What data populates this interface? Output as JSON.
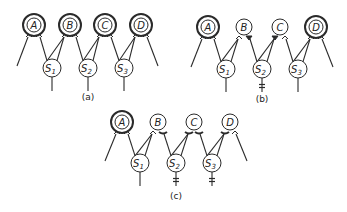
{
  "figure": {
    "panels": [
      {
        "id": "a",
        "caption": "(a)",
        "caption_pos": [
          88,
          100
        ],
        "top_y": 25,
        "bottom_y": 68,
        "units": [
          {
            "label": "A",
            "x": 34,
            "state": "double"
          },
          {
            "label": "B",
            "x": 70,
            "state": "double"
          },
          {
            "label": "C",
            "x": 105,
            "state": "double"
          },
          {
            "label": "D",
            "x": 141,
            "state": "double"
          }
        ],
        "hidden": [
          {
            "label": "S",
            "sub": "1",
            "x": 52,
            "blocked": false
          },
          {
            "label": "S",
            "sub": "2",
            "x": 88,
            "blocked": false
          },
          {
            "label": "S",
            "sub": "3",
            "x": 124,
            "blocked": false
          }
        ],
        "synapses": [
          {
            "unit": 0,
            "side": "left",
            "type": "open"
          },
          {
            "unit": 0,
            "side": "right",
            "type": "open"
          },
          {
            "unit": 1,
            "side": "left",
            "type": "open"
          },
          {
            "unit": 1,
            "side": "right",
            "type": "open"
          },
          {
            "unit": 2,
            "side": "left",
            "type": "open"
          },
          {
            "unit": 2,
            "side": "right",
            "type": "open"
          },
          {
            "unit": 3,
            "side": "left",
            "type": "open"
          },
          {
            "unit": 3,
            "side": "right",
            "type": "open"
          }
        ]
      },
      {
        "id": "b",
        "caption": "(b)",
        "caption_pos": [
          262,
          102
        ],
        "top_y": 27,
        "bottom_y": 69,
        "units": [
          {
            "label": "A",
            "x": 208,
            "state": "double"
          },
          {
            "label": "B",
            "x": 244,
            "state": "single"
          },
          {
            "label": "C",
            "x": 280,
            "state": "single"
          },
          {
            "label": "D",
            "x": 316,
            "state": "double"
          }
        ],
        "hidden": [
          {
            "label": "S",
            "sub": "1",
            "x": 226,
            "blocked": false
          },
          {
            "label": "S",
            "sub": "2",
            "x": 262,
            "blocked": true
          },
          {
            "label": "S",
            "sub": "3",
            "x": 298,
            "blocked": false
          }
        ],
        "synapses": [
          {
            "unit": 0,
            "side": "left",
            "type": "open"
          },
          {
            "unit": 0,
            "side": "right",
            "type": "open"
          },
          {
            "unit": 1,
            "side": "left",
            "type": "open"
          },
          {
            "unit": 1,
            "side": "right",
            "type": "filled"
          },
          {
            "unit": 2,
            "side": "left",
            "type": "filled"
          },
          {
            "unit": 2,
            "side": "right",
            "type": "open"
          },
          {
            "unit": 3,
            "side": "left",
            "type": "open"
          },
          {
            "unit": 3,
            "side": "right",
            "type": "open"
          }
        ]
      },
      {
        "id": "c",
        "caption": "(c)",
        "caption_pos": [
          176,
          199
        ],
        "top_y": 122,
        "bottom_y": 163,
        "units": [
          {
            "label": "A",
            "x": 122,
            "state": "double"
          },
          {
            "label": "B",
            "x": 158,
            "state": "single"
          },
          {
            "label": "C",
            "x": 194,
            "state": "single"
          },
          {
            "label": "D",
            "x": 230,
            "state": "single"
          }
        ],
        "hidden": [
          {
            "label": "S",
            "sub": "1",
            "x": 140,
            "blocked": false
          },
          {
            "label": "S",
            "sub": "2",
            "x": 176,
            "blocked": true
          },
          {
            "label": "S",
            "sub": "3",
            "x": 212,
            "blocked": true
          }
        ],
        "synapses": [
          {
            "unit": 0,
            "side": "left",
            "type": "open"
          },
          {
            "unit": 0,
            "side": "right",
            "type": "open"
          },
          {
            "unit": 1,
            "side": "left",
            "type": "open"
          },
          {
            "unit": 1,
            "side": "right",
            "type": "bar"
          },
          {
            "unit": 2,
            "side": "left",
            "type": "bar"
          },
          {
            "unit": 2,
            "side": "right",
            "type": "bar"
          },
          {
            "unit": 3,
            "side": "left",
            "type": "bar"
          },
          {
            "unit": 3,
            "side": "right",
            "type": "open"
          }
        ]
      }
    ],
    "style": {
      "stroke": "#2a2a2a",
      "fill": "#ffffff",
      "unit_radius": 10,
      "hidden_radius": 9
    }
  }
}
